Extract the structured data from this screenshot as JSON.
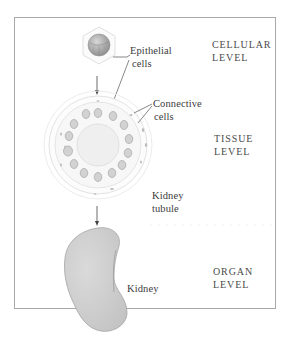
{
  "diagram": {
    "colors": {
      "frame": "#a8a8a8",
      "cell_fill": "#b9b9b9",
      "kidney_fill": "#cfcfcf",
      "leader_line": "#555555",
      "arrow": "#444444",
      "text": "#3c3c3c"
    },
    "levels": [
      {
        "line1": "CELLULAR",
        "line2": "LEVEL"
      },
      {
        "line1": "TISSUE",
        "line2": "LEVEL"
      },
      {
        "line1": "ORGAN",
        "line2": "LEVEL"
      }
    ],
    "labels": {
      "epithelial": {
        "line1": "Epithelial",
        "line2": "cells"
      },
      "connective": {
        "line1": "Connective",
        "line2": "cells"
      },
      "tubule": {
        "line1": "Kidney",
        "line2": "tubule"
      },
      "kidney": "Kidney"
    },
    "icons": [
      "cell-icon",
      "kidney-tubule-cross-section",
      "kidney-organ-icon",
      "arrow-down-icon"
    ]
  }
}
